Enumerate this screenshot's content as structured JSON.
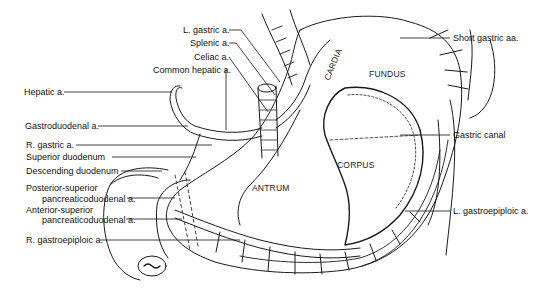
{
  "figure": {
    "labels_left": [
      {
        "id": "l-gastric",
        "text": "L. gastric a."
      },
      {
        "id": "splenic",
        "text": "Splenic a."
      },
      {
        "id": "celiac",
        "text": "Celiac a."
      },
      {
        "id": "common-hepatic",
        "text": "Common hepatic a."
      },
      {
        "id": "hepatic",
        "text": "Hepatic a."
      },
      {
        "id": "gastroduodenal",
        "text": "Gastroduodenal a."
      },
      {
        "id": "r-gastric",
        "text": "R. gastric a."
      },
      {
        "id": "superior-duodenum",
        "text": "Superior duodenum"
      },
      {
        "id": "descending-duodenum",
        "text": "Descending duodenum"
      },
      {
        "id": "post-sup-pd-1",
        "text": "Posterior-superior"
      },
      {
        "id": "post-sup-pd-2",
        "text": "pancreaticoduodenal a."
      },
      {
        "id": "ant-sup-pd-1",
        "text": "Anterior-superior"
      },
      {
        "id": "ant-sup-pd-2",
        "text": "pancreaticoduodenal a."
      },
      {
        "id": "r-gastroepiploic",
        "text": "R. gastroepiploic a."
      }
    ],
    "labels_right": [
      {
        "id": "short-gastric",
        "text": "Short gastric aa."
      },
      {
        "id": "gastric-canal",
        "text": "Gastric canal"
      },
      {
        "id": "l-gastroepiploic",
        "text": "L. gastroepiploic a."
      }
    ],
    "regions": [
      {
        "id": "cardia",
        "text": "CARDIA"
      },
      {
        "id": "fundus",
        "text": "FUNDUS"
      },
      {
        "id": "corpus",
        "text": "CORPUS"
      },
      {
        "id": "antrum",
        "text": "ANTRUM"
      }
    ]
  }
}
